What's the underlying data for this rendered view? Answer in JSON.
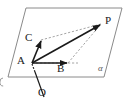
{
  "figure": {
    "type": "geometry-vector-diagram",
    "colors": {
      "stroke": "#1a1a1a",
      "plane_edge": "#8a8a8a",
      "dashed": "#9a9a9a",
      "background": "#ffffff"
    },
    "plane": {
      "name": "alpha",
      "label": "α",
      "shape": "parallelogram",
      "vertices": [
        [
          26,
          8
        ],
        [
          122,
          8
        ],
        [
          104,
          77
        ],
        [
          8,
          77
        ]
      ]
    },
    "points": [
      {
        "name": "A",
        "label": "A",
        "x": 32,
        "y": 63,
        "label_x": 17,
        "label_y": 56
      },
      {
        "name": "B",
        "label": "B",
        "x": 68,
        "y": 63,
        "label_x": 57,
        "label_y": 64
      },
      {
        "name": "C",
        "label": "C",
        "x": 41,
        "y": 40,
        "label_x": 25,
        "label_y": 33
      },
      {
        "name": "P",
        "label": "P",
        "x": 101,
        "y": 24,
        "label_x": 105,
        "label_y": 16
      },
      {
        "name": "O",
        "label": "O",
        "x": 44,
        "y": 97,
        "label_x": 38,
        "label_y": 88
      }
    ],
    "vectors": [
      {
        "name": "AB",
        "from": "A",
        "to": "B",
        "style": "solid-arrow"
      },
      {
        "name": "AC",
        "from": "A",
        "to": "C",
        "style": "solid-arrow"
      },
      {
        "name": "AP",
        "from": "A",
        "to": "P",
        "style": "solid-arrow"
      }
    ],
    "dashed_construction": {
      "name": "parallelogram-ABPC",
      "segments": [
        {
          "from": [
            41,
            40
          ],
          "to": [
            101,
            24
          ],
          "note": "C to P"
        },
        {
          "from": [
            68,
            63
          ],
          "to": [
            101,
            24
          ],
          "note": "B to P"
        },
        {
          "from": [
            32,
            63
          ],
          "to": [
            68,
            63
          ],
          "note": "A to B underlay"
        },
        {
          "from": [
            32,
            63
          ],
          "to": [
            41,
            40
          ],
          "note": "A to C underlay"
        }
      ]
    },
    "line_OA": {
      "name": "OA",
      "from": [
        44,
        97
      ],
      "to": [
        32,
        63
      ],
      "dashed_above_plane_edge": true,
      "note": "solid below plane, dashed where hidden behind plane"
    },
    "edge_marks": [
      {
        "name": "left-edge-partial-glyph",
        "x": 1,
        "y": 80
      }
    ]
  }
}
